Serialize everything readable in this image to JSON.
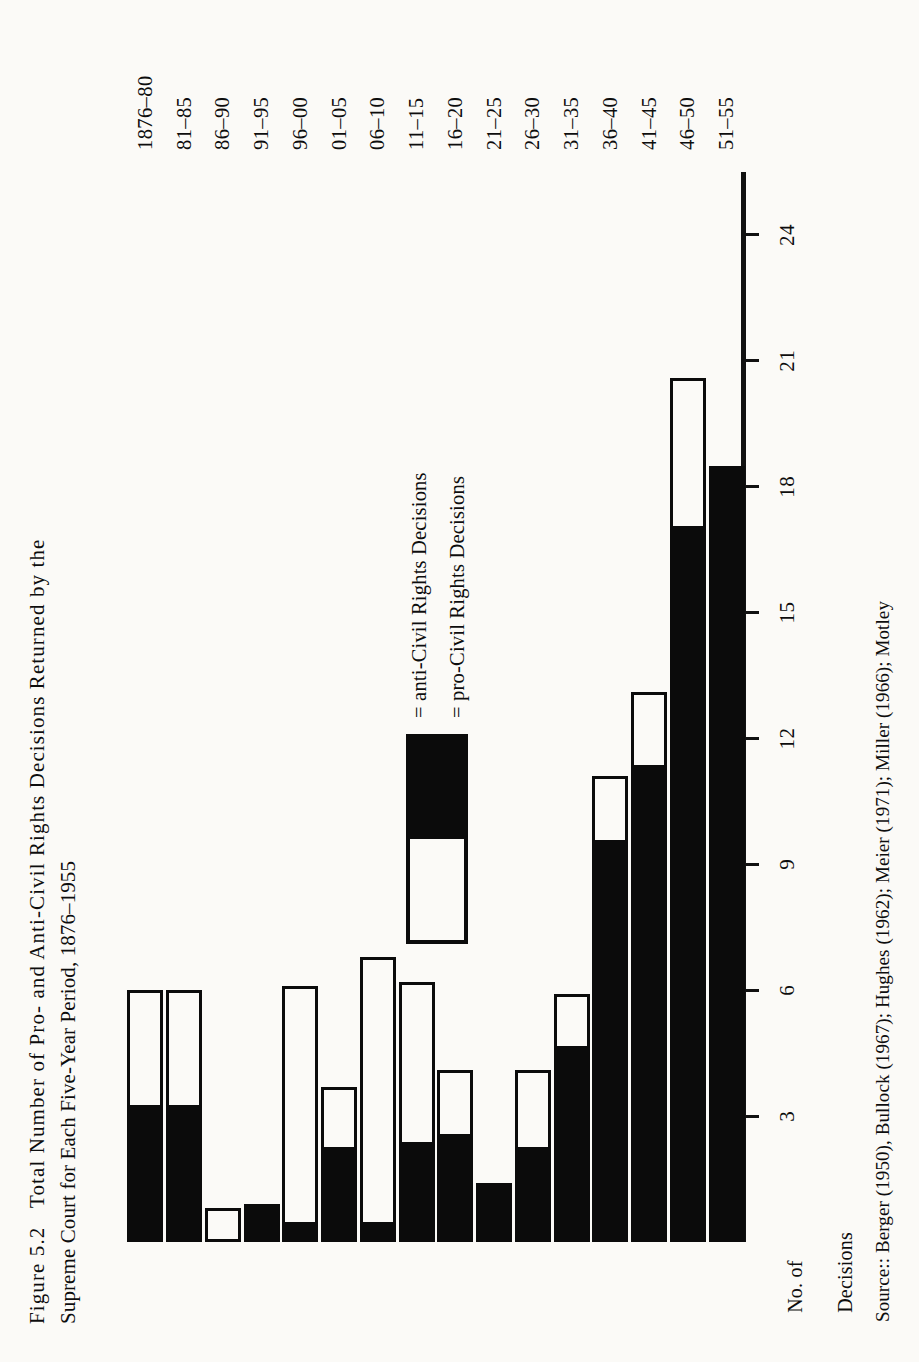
{
  "figure": {
    "caption_line1": "Figure 5.2   Total Number of Pro- and Anti-Civil Rights Decisions Returned by the",
    "caption_line2": "Supreme Court for Each Five-Year Period, 1876–1955",
    "source_note": "Source:: Berger (1950), Bullock (1967); Hughes (1962); Meier (1971); Miller (1966); Motley"
  },
  "axis": {
    "value_axis_title_line1": "No. of",
    "value_axis_title_line2": "Decisions",
    "value_ticks": [
      3,
      6,
      9,
      12,
      15,
      18,
      21,
      24
    ],
    "value_min": 0,
    "value_max": 25.5
  },
  "legend": {
    "entries": [
      {
        "label": "= anti-Civil Rights Decisions",
        "swatch": "solid-black"
      },
      {
        "label": "= pro-Civil Rights Decisions",
        "swatch": "outlined-white"
      }
    ]
  },
  "chart_data": {
    "type": "bar",
    "title": "Figure 5.2   Total Number of Pro- and Anti-Civil Rights Decisions Returned by the Supreme Court for Each Five-Year Period, 1876–1955",
    "orientation": "horizontal",
    "stacked": true,
    "xlabel": "No. of Decisions",
    "ylabel": "",
    "xlim": [
      0,
      25.5
    ],
    "xticks": [
      3,
      6,
      9,
      12,
      15,
      18,
      21,
      24
    ],
    "grid": false,
    "legend_position": "inside-left",
    "categories": [
      "1876–80",
      "81–85",
      "86–90",
      "91–95",
      "96–00",
      "01–05",
      "06–10",
      "11–15",
      "16–20",
      "21–25",
      "26–30",
      "31–35",
      "36–40",
      "41–45",
      "46–50",
      "51–55"
    ],
    "series": [
      {
        "name": "anti-Civil Rights Decisions",
        "color": "#0b0b0b",
        "values": [
          3.2,
          3.2,
          0.0,
          0.9,
          0.4,
          2.2,
          0.4,
          2.3,
          2.5,
          1.4,
          2.2,
          4.6,
          9.5,
          11.3,
          17.0,
          18.5
        ]
      },
      {
        "name": "pro-Civil Rights Decisions",
        "color": "#ffffff",
        "values": [
          2.8,
          2.8,
          0.8,
          0.0,
          5.7,
          1.5,
          6.4,
          3.9,
          1.6,
          0.0,
          1.9,
          1.3,
          1.6,
          1.8,
          3.6,
          0.0
        ]
      }
    ],
    "totals": [
      6.0,
      6.0,
      0.8,
      0.9,
      6.1,
      3.7,
      6.8,
      6.2,
      4.1,
      1.4,
      4.1,
      5.9,
      11.1,
      13.1,
      20.6,
      18.5
    ]
  }
}
